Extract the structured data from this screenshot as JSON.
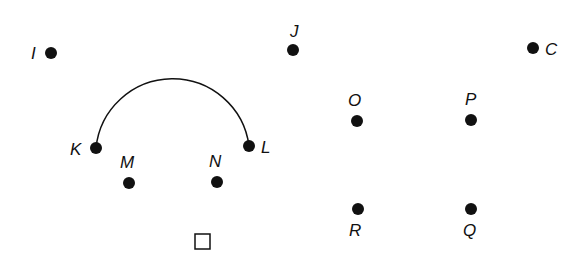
{
  "diagram": {
    "background": "#ffffff",
    "ink": "#111111",
    "point_radius": 6,
    "points": [
      {
        "label": "I",
        "x": 51,
        "y": 53,
        "lx": 31,
        "ly": 59
      },
      {
        "label": "J",
        "x": 293,
        "y": 50,
        "lx": 290,
        "ly": 37
      },
      {
        "label": "C",
        "x": 533,
        "y": 48,
        "lx": 545,
        "ly": 55
      },
      {
        "label": "K",
        "x": 96,
        "y": 148,
        "lx": 70,
        "ly": 155
      },
      {
        "label": "L",
        "x": 249,
        "y": 146,
        "lx": 261,
        "ly": 153
      },
      {
        "label": "M",
        "x": 129,
        "y": 183,
        "lx": 120,
        "ly": 168
      },
      {
        "label": "N",
        "x": 217,
        "y": 182,
        "lx": 209,
        "ly": 167
      },
      {
        "label": "O",
        "x": 357,
        "y": 121,
        "lx": 348,
        "ly": 106
      },
      {
        "label": "P",
        "x": 471,
        "y": 120,
        "lx": 465,
        "ly": 105
      },
      {
        "label": "R",
        "x": 358,
        "y": 209,
        "lx": 349,
        "ly": 236
      },
      {
        "label": "Q",
        "x": 471,
        "y": 209,
        "lx": 463,
        "ly": 236
      }
    ],
    "arc": {
      "from": "K",
      "to": "L",
      "cx": 172.5,
      "cy": 147,
      "r": 77
    },
    "square": {
      "x": 195,
      "y": 234,
      "size": 15
    }
  }
}
